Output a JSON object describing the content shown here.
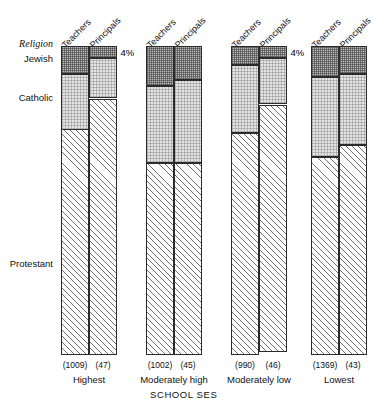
{
  "chart_data": {
    "type": "bar",
    "subtype": "stacked-percentage",
    "title": "",
    "xlabel": "SCHOOL SES",
    "ylabel": "Religion",
    "ylim": [
      0,
      100
    ],
    "grid": false,
    "legend_position": "none",
    "row_axis_label": "Religion",
    "row_categories": [
      "Jewish",
      "Catholic",
      "Protestant"
    ],
    "column_headers": [
      "Teachers",
      "Principals"
    ],
    "categories": [
      "Highest",
      "Moderately high",
      "Moderately low",
      "Lowest"
    ],
    "groups": [
      {
        "category": "Highest",
        "bars": [
          {
            "series": "Teachers",
            "n": "(1009)",
            "jewish": 9,
            "catholic": 18,
            "protestant": 73,
            "jewish_label": "9%",
            "catholic_label": "18%",
            "protestant_label": "73%",
            "jewish_label_outside": false
          },
          {
            "series": "Principals",
            "n": "(47)",
            "jewish": 4,
            "catholic": 13,
            "protestant": 83,
            "jewish_label": "4%",
            "catholic_label": "13%",
            "protestant_label": "83%",
            "jewish_label_outside": true
          }
        ]
      },
      {
        "category": "Moderately high",
        "bars": [
          {
            "series": "Teachers",
            "n": "(1002)",
            "jewish": 13,
            "catholic": 25,
            "protestant": 62,
            "jewish_label": "13%",
            "catholic_label": "25%",
            "protestant_label": "62%",
            "jewish_label_outside": false
          },
          {
            "series": "Principals",
            "n": "(45)",
            "jewish": 11,
            "catholic": 27,
            "protestant": 62,
            "jewish_label": "11%",
            "catholic_label": "27%",
            "protestant_label": "62%",
            "jewish_label_outside": false
          }
        ]
      },
      {
        "category": "Moderately low",
        "bars": [
          {
            "series": "Teachers",
            "n": "(990)",
            "jewish": 6,
            "catholic": 22,
            "protestant": 72,
            "jewish_label": "6%",
            "catholic_label": "22%",
            "protestant_label": "72%",
            "jewish_label_outside": false
          },
          {
            "series": "Principals",
            "n": "(46)",
            "jewish": 4,
            "catholic": 15,
            "protestant": 80,
            "jewish_label": "4%",
            "catholic_label": "15%",
            "protestant_label": "80%",
            "jewish_label_outside": true
          }
        ]
      },
      {
        "category": "Lowest",
        "bars": [
          {
            "series": "Teachers",
            "n": "(1369)",
            "jewish": 10,
            "catholic": 26,
            "protestant": 64,
            "jewish_label": "10%",
            "catholic_label": "26%",
            "protestant_label": "64%",
            "jewish_label_outside": false
          },
          {
            "series": "Principals",
            "n": "(43)",
            "jewish": 9,
            "catholic": 23,
            "protestant": 68,
            "jewish_label": "9%",
            "catholic_label": "23%",
            "protestant_label": "68%",
            "jewish_label_outside": false
          }
        ]
      }
    ],
    "colors": {
      "jewish_fill": "#b8b8b8",
      "catholic_fill": "#e4e4e4",
      "protestant_fill": "#ffffff",
      "outline": "#2b2b2b",
      "text": "#111111"
    }
  }
}
